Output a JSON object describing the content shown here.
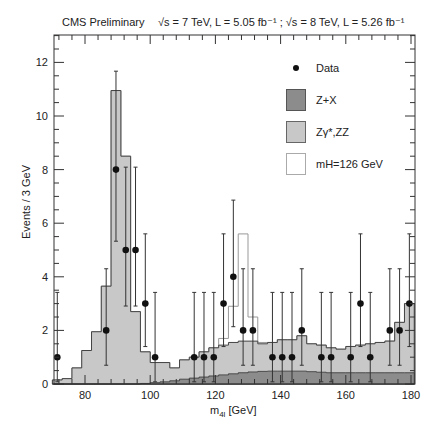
{
  "header": {
    "experiment": "CMS Preliminary",
    "energy_lumi": "√s = 7 TeV, L = 5.05 fb⁻¹ ; √s = 8 TeV, L = 5.26 fb⁻¹"
  },
  "chart_data": {
    "type": "bar",
    "xlabel": "m4l [GeV]",
    "ylabel": "Events / 3 GeV",
    "xlim": [
      70,
      181
    ],
    "ylim": [
      0,
      13
    ],
    "xticks": [
      80,
      100,
      120,
      140,
      160,
      180
    ],
    "yticks": [
      0,
      2,
      4,
      6,
      8,
      10,
      12
    ],
    "grid": false,
    "legend_position": "upper right",
    "bin_edges": [
      70,
      73,
      76,
      79,
      82,
      85,
      88,
      91,
      94,
      97,
      100,
      103,
      106,
      109,
      112,
      115,
      118,
      121,
      124,
      127,
      130,
      133,
      136,
      139,
      142,
      145,
      148,
      151,
      154,
      157,
      160,
      163,
      166,
      169,
      172,
      175,
      178,
      181
    ],
    "series": [
      {
        "name": "Z+X",
        "color": "#8c8c8c",
        "values": [
          0,
          0,
          0,
          0,
          0,
          0,
          0,
          0,
          0,
          0.02,
          0.05,
          0.08,
          0.12,
          0.18,
          0.22,
          0.26,
          0.3,
          0.34,
          0.38,
          0.42,
          0.45,
          0.47,
          0.48,
          0.48,
          0.48,
          0.48,
          0.46,
          0.44,
          0.42,
          0.42,
          0.42,
          0.42,
          0.42,
          0.42,
          0.42,
          0.42,
          0.42
        ]
      },
      {
        "name": "Zγ*,ZZ",
        "color": "#c8c8c8",
        "stacked_total": true,
        "values": [
          0.15,
          0.2,
          0.6,
          1.25,
          1.95,
          3.65,
          10.95,
          8.5,
          2.7,
          1.2,
          0.8,
          0.8,
          0.6,
          0.9,
          1.0,
          1.2,
          1.35,
          1.45,
          1.55,
          1.6,
          1.6,
          1.5,
          1.55,
          1.65,
          1.65,
          1.8,
          1.5,
          1.45,
          1.35,
          1.3,
          1.4,
          1.45,
          1.5,
          1.55,
          1.6,
          2.3,
          3.0
        ]
      },
      {
        "name": "mH=126 GeV",
        "color": "#ffffff",
        "stacked_total": true,
        "values": [
          0.15,
          0.2,
          0.6,
          1.25,
          1.95,
          3.65,
          10.95,
          8.5,
          2.7,
          1.2,
          0.8,
          0.8,
          0.6,
          0.9,
          1.0,
          1.2,
          1.35,
          1.7,
          2.9,
          5.6,
          2.5,
          1.55,
          1.55,
          1.65,
          1.65,
          1.8,
          1.5,
          1.45,
          1.35,
          1.3,
          1.4,
          1.45,
          1.5,
          1.55,
          1.6,
          2.3,
          3.0
        ]
      },
      {
        "name": "Data",
        "color": "#111111",
        "type": "scatter",
        "x": [
          71.5,
          86.5,
          89.5,
          92.5,
          95.5,
          98.5,
          101.5,
          113.5,
          116.5,
          119.5,
          122.5,
          125.5,
          128.5,
          131.5,
          137.5,
          140.5,
          143.5,
          146.5,
          152.5,
          155.5,
          161.5,
          164.5,
          167.5,
          173.5,
          176.5,
          179.5
        ],
        "y": [
          1,
          2,
          8,
          5,
          5,
          3,
          1,
          1,
          1,
          1,
          3,
          4,
          2,
          2,
          1,
          1,
          1,
          2,
          1,
          1,
          1,
          3,
          1,
          2,
          2,
          3
        ]
      }
    ]
  },
  "legend": {
    "items": [
      {
        "label": "Data"
      },
      {
        "label": "Z+X"
      },
      {
        "label": "Zγ*,ZZ"
      },
      {
        "label": "mH=126 GeV"
      }
    ]
  },
  "axes": {
    "xlabel_main": "m",
    "xlabel_sub": "4l",
    "xlabel_unit": " [GeV]",
    "ylabel": "Events / 3 GeV"
  }
}
